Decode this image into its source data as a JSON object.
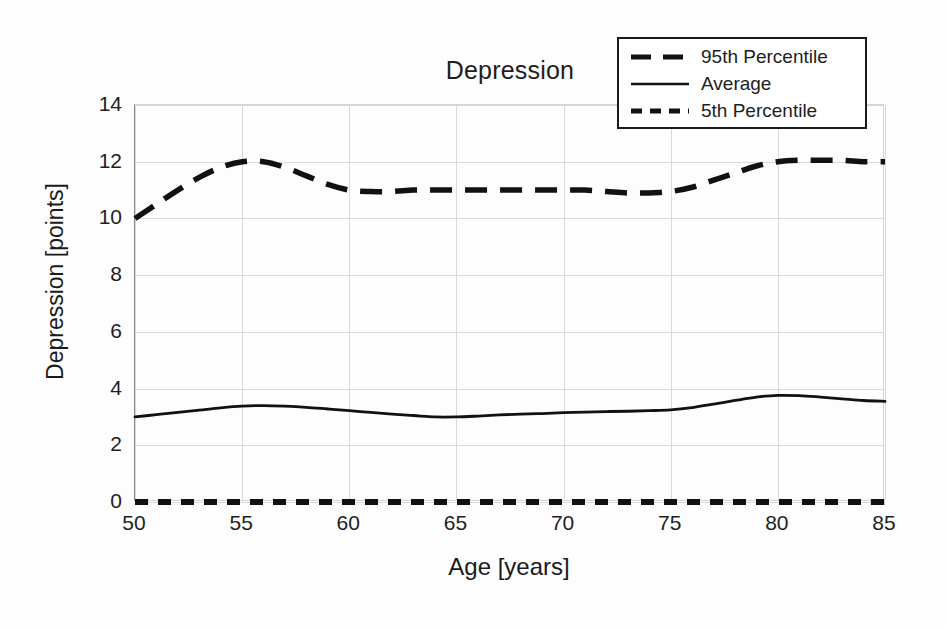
{
  "chart_data": {
    "type": "line",
    "title": "Depression",
    "xlabel": "Age [years]",
    "ylabel": "Depression [points]",
    "xlim": [
      50,
      85
    ],
    "ylim": [
      0,
      14
    ],
    "xticks": [
      50,
      55,
      60,
      65,
      70,
      75,
      80,
      85
    ],
    "yticks": [
      0,
      2,
      4,
      6,
      8,
      10,
      12,
      14
    ],
    "grid": true,
    "legend_position": "top-right",
    "x": [
      50,
      51,
      52,
      53,
      54,
      55,
      56,
      57,
      58,
      59,
      60,
      61,
      62,
      63,
      64,
      65,
      66,
      67,
      68,
      69,
      70,
      71,
      72,
      73,
      74,
      75,
      76,
      77,
      78,
      79,
      80,
      81,
      82,
      83,
      84,
      85
    ],
    "series": [
      {
        "name": "95th Percentile",
        "style": "long-dashed",
        "color": "#111111",
        "values": [
          10.0,
          10.5,
          11.0,
          11.45,
          11.8,
          12.0,
          12.0,
          11.8,
          11.5,
          11.2,
          11.0,
          10.95,
          10.95,
          11.0,
          11.0,
          11.0,
          11.0,
          11.0,
          11.0,
          11.0,
          11.0,
          11.0,
          10.95,
          10.9,
          10.9,
          10.95,
          11.1,
          11.35,
          11.6,
          11.85,
          12.0,
          12.05,
          12.05,
          12.05,
          12.0,
          12.0
        ]
      },
      {
        "name": "Average",
        "style": "solid",
        "color": "#111111",
        "values": [
          3.0,
          3.08,
          3.16,
          3.24,
          3.32,
          3.38,
          3.4,
          3.38,
          3.34,
          3.28,
          3.22,
          3.16,
          3.1,
          3.05,
          3.0,
          3.0,
          3.03,
          3.07,
          3.1,
          3.12,
          3.15,
          3.17,
          3.19,
          3.2,
          3.22,
          3.25,
          3.33,
          3.45,
          3.58,
          3.7,
          3.76,
          3.75,
          3.7,
          3.64,
          3.58,
          3.55
        ]
      },
      {
        "name": "5th Percentile",
        "style": "short-dashed",
        "color": "#111111",
        "values": [
          0.0,
          0.0,
          0.0,
          0.0,
          0.0,
          0.0,
          0.0,
          0.0,
          0.0,
          0.0,
          0.0,
          0.0,
          0.0,
          0.0,
          0.0,
          0.0,
          0.0,
          0.0,
          0.0,
          0.0,
          0.0,
          0.0,
          0.0,
          0.0,
          0.0,
          0.0,
          0.0,
          0.0,
          0.0,
          0.0,
          0.0,
          0.0,
          0.0,
          0.0,
          0.0,
          0.0
        ]
      }
    ]
  },
  "legend": {
    "entries": [
      {
        "label": "95th Percentile"
      },
      {
        "label": "Average"
      },
      {
        "label": "5th Percentile"
      }
    ]
  }
}
